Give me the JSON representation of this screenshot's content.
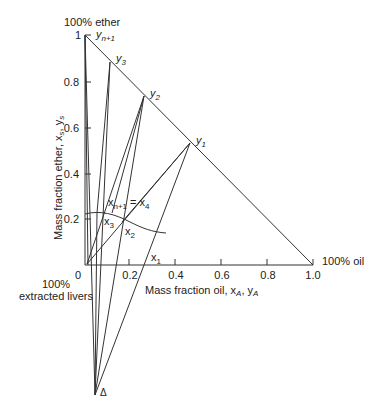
{
  "diagram": {
    "corner_labels": {
      "top": "100% ether",
      "right": "100% oil",
      "origin_line1": "100%",
      "origin_line2": "extracted livers"
    },
    "x_axis": {
      "label": "Mass fraction oil, x",
      "label_sub1": "A",
      "label_mid": ", y",
      "label_sub2": "A",
      "ticks": [
        "0",
        "0.2",
        "0.4",
        "0.6",
        "0.8",
        "1.0"
      ]
    },
    "y_axis": {
      "label": "Mass fraction ether, x",
      "label_sub1": "s",
      "label_mid": ", y",
      "label_sub2": "s",
      "ticks": [
        "0.2",
        "0.4",
        "0.6",
        "0.8",
        "1"
      ]
    },
    "points": {
      "yn1": {
        "base": "y",
        "sub": "n+1"
      },
      "y3": {
        "base": "y",
        "sub": "3"
      },
      "y2": {
        "base": "y",
        "sub": "2"
      },
      "y1": {
        "base": "y",
        "sub": "1"
      },
      "xn1": {
        "base": "x",
        "sub": "n+1"
      },
      "eq": "=",
      "x4": {
        "base": "x",
        "sub": "4"
      },
      "x3": {
        "base": "x",
        "sub": "3"
      },
      "x2": {
        "base": "x",
        "sub": "2"
      },
      "x1": {
        "base": "x",
        "sub": "1"
      },
      "delta": "Δ"
    }
  }
}
